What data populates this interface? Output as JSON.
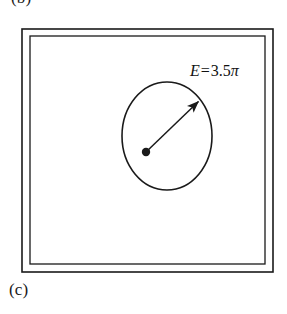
{
  "figure": {
    "panel_label_top": "(b)",
    "panel_label_bottom": "(c)",
    "background_color": "#ffffff",
    "stroke_color": "#1a1a1a"
  },
  "annotation": {
    "variable": "E",
    "operator": "=",
    "value": "3.5",
    "unit_symbol": "π",
    "full_text": "E = 3.5π"
  },
  "shapes": {
    "outer_rectangle": {
      "name": "outer-boundary-rectangle",
      "x": 22,
      "y": 29,
      "width": 251,
      "height": 243
    },
    "inner_rectangle": {
      "name": "inner-boundary-rectangle",
      "x": 30,
      "y": 36,
      "width": 235,
      "height": 228
    },
    "ellipse": {
      "name": "region-ellipse",
      "cx": 167,
      "cy": 136,
      "rx": 45,
      "ry": 54
    },
    "center_point": {
      "name": "ellipse-center-dot",
      "cx": 146,
      "cy": 152,
      "r": 4
    },
    "radius_arrow": {
      "name": "radius-arrow",
      "x1": 146,
      "y1": 152,
      "x2": 200,
      "y2": 100
    }
  }
}
